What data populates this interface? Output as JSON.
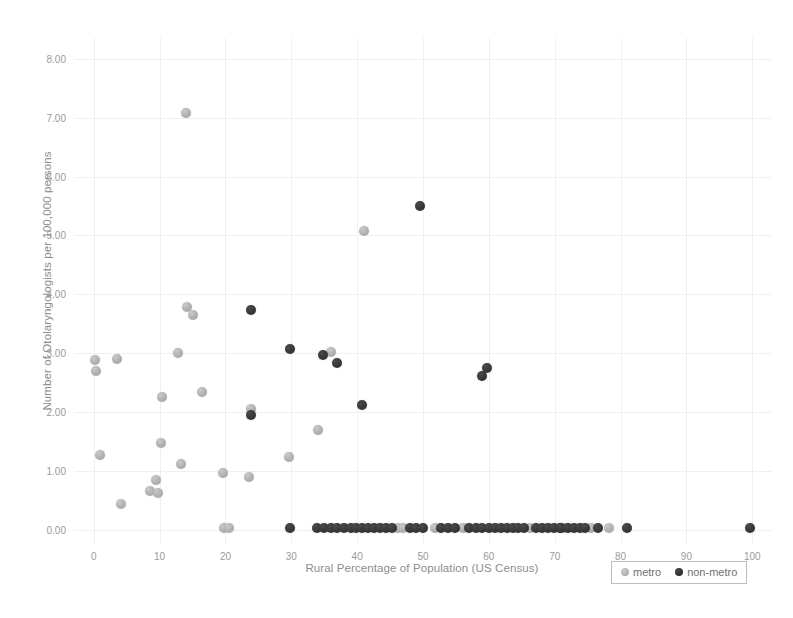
{
  "chart_data": {
    "type": "scatter",
    "title": "",
    "xlabel": "Rural Percentage of Population (US Census)",
    "ylabel": "Number of Otolaryngologists per 100,000 persons",
    "xlim": [
      -3,
      103
    ],
    "ylim": [
      -0.25,
      8.35
    ],
    "xticks": [
      "0",
      "10",
      "20",
      "30",
      "40",
      "50",
      "60",
      "70",
      "80",
      "90",
      "100"
    ],
    "xtick_values": [
      0,
      10,
      20,
      30,
      40,
      50,
      60,
      70,
      80,
      90,
      100
    ],
    "yticks": [
      "0.00",
      "1.00",
      "2.00",
      "3.00",
      "4.00",
      "5.00",
      "6.00",
      "7.00",
      "8.00"
    ],
    "ytick_values": [
      0,
      1,
      2,
      3,
      4,
      5,
      6,
      7,
      8
    ],
    "grid": true,
    "legend_position": "bottom-right",
    "colors": {
      "metro": "#b4b4b4",
      "non-metro": "#333333",
      "grid": "#f0f0f0",
      "axis_text": "#9a9a9a",
      "label_text": "#8d8d8d",
      "background": "#ffffff"
    },
    "series": [
      {
        "name": "metro",
        "color": "#b4b4b4",
        "points": [
          [
            0.2,
            2.88
          ],
          [
            0.3,
            2.7
          ],
          [
            1.0,
            1.28
          ],
          [
            3.6,
            2.9
          ],
          [
            4.1,
            0.45
          ],
          [
            8.6,
            0.67
          ],
          [
            9.4,
            0.86
          ],
          [
            9.8,
            0.64
          ],
          [
            10.2,
            1.48
          ],
          [
            10.4,
            2.26
          ],
          [
            12.8,
            3.0
          ],
          [
            13.2,
            1.12
          ],
          [
            14.0,
            7.07
          ],
          [
            14.1,
            3.78
          ],
          [
            15.0,
            3.65
          ],
          [
            16.4,
            2.35
          ],
          [
            19.6,
            0.97
          ],
          [
            19.8,
            0.03
          ],
          [
            20.6,
            0.03
          ],
          [
            23.6,
            0.9
          ],
          [
            23.9,
            2.05
          ],
          [
            29.6,
            1.25
          ],
          [
            34.0,
            1.7
          ],
          [
            36.0,
            3.03
          ],
          [
            41.0,
            5.08
          ],
          [
            46.2,
            0.03
          ],
          [
            47.0,
            0.03
          ],
          [
            51.8,
            0.03
          ],
          [
            56.0,
            0.03
          ],
          [
            66.2,
            0.03
          ],
          [
            71.6,
            0.03
          ],
          [
            75.5,
            0.03
          ],
          [
            78.2,
            0.03
          ]
        ]
      },
      {
        "name": "non-metro",
        "color": "#333333",
        "points": [
          [
            23.9,
            3.73
          ],
          [
            23.9,
            1.95
          ],
          [
            29.8,
            3.08
          ],
          [
            29.8,
            0.03
          ],
          [
            34.8,
            2.97
          ],
          [
            36.9,
            2.83
          ],
          [
            40.8,
            2.12
          ],
          [
            49.6,
            5.5
          ],
          [
            59.0,
            2.62
          ],
          [
            59.7,
            2.75
          ],
          [
            33.9,
            0.03
          ],
          [
            35.0,
            0.03
          ],
          [
            36.1,
            0.03
          ],
          [
            37.0,
            0.03
          ],
          [
            38.0,
            0.03
          ],
          [
            39.0,
            0.03
          ],
          [
            39.9,
            0.03
          ],
          [
            40.8,
            0.03
          ],
          [
            41.7,
            0.03
          ],
          [
            42.6,
            0.03
          ],
          [
            43.5,
            0.03
          ],
          [
            44.4,
            0.03
          ],
          [
            45.3,
            0.03
          ],
          [
            48.0,
            0.03
          ],
          [
            49.0,
            0.03
          ],
          [
            50.0,
            0.03
          ],
          [
            52.8,
            0.03
          ],
          [
            53.8,
            0.03
          ],
          [
            54.8,
            0.03
          ],
          [
            57.0,
            0.03
          ],
          [
            58.0,
            0.03
          ],
          [
            59.0,
            0.03
          ],
          [
            60.0,
            0.03
          ],
          [
            60.9,
            0.03
          ],
          [
            61.8,
            0.03
          ],
          [
            62.7,
            0.03
          ],
          [
            63.6,
            0.03
          ],
          [
            64.5,
            0.03
          ],
          [
            65.3,
            0.03
          ],
          [
            67.2,
            0.03
          ],
          [
            68.1,
            0.03
          ],
          [
            69.0,
            0.03
          ],
          [
            69.9,
            0.03
          ],
          [
            70.8,
            0.03
          ],
          [
            71.0,
            0.03
          ],
          [
            72.0,
            0.03
          ],
          [
            72.9,
            0.03
          ],
          [
            73.8,
            0.03
          ],
          [
            74.6,
            0.03
          ],
          [
            76.6,
            0.03
          ],
          [
            81.0,
            0.03
          ],
          [
            99.6,
            0.03
          ]
        ]
      }
    ]
  },
  "legend": {
    "items": [
      {
        "label": "metro",
        "key": "metro"
      },
      {
        "label": "non-metro",
        "key": "non-metro"
      }
    ]
  }
}
